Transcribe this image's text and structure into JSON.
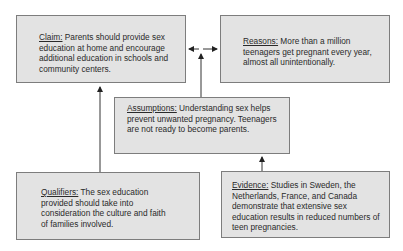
{
  "diagram": {
    "type": "Toulmin argument model",
    "nodes": {
      "claim": {
        "label": "Claim:",
        "text": " Parents should provide sex education at home and encourage additional education in schools and community centers."
      },
      "reasons": {
        "label": "Reasons:",
        "text": " More than a million teenagers get pregnant every year, almost all unintentionally."
      },
      "assumptions": {
        "label": "Assumptions:",
        "text": " Understanding sex helps prevent unwanted pregnancy. Teenagers are not ready to become parents."
      },
      "qualifiers": {
        "label": "Qualifiers:",
        "text": " The sex education provided should take into consideration the culture and faith of families involved."
      },
      "evidence": {
        "label": "Evidence:",
        "text": " Studies in Sweden, the Netherlands, France, and Canada demonstrate that extensive sex education results in reduced numbers of teen pregnancies."
      }
    },
    "edges": [
      {
        "from": "reasons",
        "to": "claim",
        "type": "bidirectional"
      },
      {
        "from": "assumptions",
        "to": "claim-reasons-link"
      },
      {
        "from": "qualifiers",
        "to": "claim"
      },
      {
        "from": "evidence",
        "to": "assumptions"
      }
    ],
    "colors": {
      "box_fill": "#e3e3e3",
      "box_border": "#7d7d7d",
      "arrow": "#333333"
    }
  }
}
